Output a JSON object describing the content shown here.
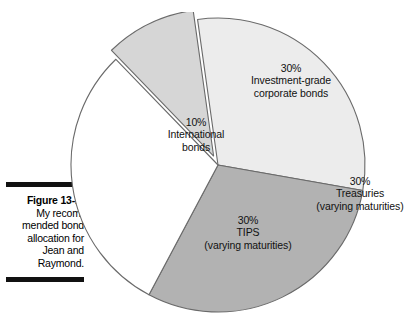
{
  "caption": {
    "figure_number": "Figure 13-1:",
    "body": "My recom-mended bond allocation for Jean and Raymond."
  },
  "chart_data": {
    "type": "pie",
    "title": "",
    "categories": [
      "Investment-grade corporate bonds",
      "Treasuries (varying maturities)",
      "TIPS (varying maturities)",
      "International bonds"
    ],
    "values": [
      30,
      30,
      30,
      10
    ],
    "unit": "%",
    "legend": "none",
    "labels_inside_slices": true,
    "slices": [
      {
        "name": "Investment-grade corporate bonds",
        "percent_label": "30%",
        "line1": "Investment-grade",
        "line2": "corporate bonds",
        "value": 30,
        "color": "#ececec",
        "exploded": false
      },
      {
        "name": "Treasuries",
        "percent_label": "30%",
        "line1": "Treasuries",
        "line2": "(varying maturities)",
        "value": 30,
        "color": "#b2b2b2",
        "exploded": false
      },
      {
        "name": "TIPS",
        "percent_label": "30%",
        "line1": "TIPS",
        "line2": "(varying maturities)",
        "value": 30,
        "color": "#ffffff",
        "exploded": false
      },
      {
        "name": "International bonds",
        "percent_label": "10%",
        "line1": "International",
        "line2": "bonds",
        "value": 10,
        "color": "#d6d6d6",
        "exploded": true
      }
    ],
    "stroke_color": "#6a6a6a"
  }
}
